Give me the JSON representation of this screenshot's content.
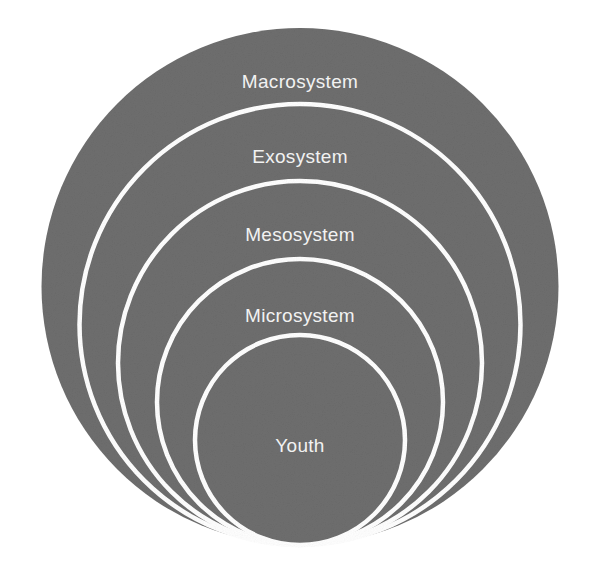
{
  "diagram": {
    "type": "nested-concentric-circles",
    "canvas": {
      "width": 600,
      "height": 574
    },
    "colors": {
      "background": "#ffffff",
      "fill": "#6e6e6e",
      "fill_dark": "#666666",
      "stroke": "#ffffff",
      "label_text": "#f2f2f2"
    },
    "layers": [
      {
        "id": "macrosystem",
        "label": "Macrosystem",
        "level": 1,
        "cx": 300,
        "cy": 286.5,
        "r": 258.5,
        "label_x": 300,
        "label_y": 83
      },
      {
        "id": "exosystem",
        "label": "Exosystem",
        "level": 2,
        "cx": 300,
        "cy": 324.5,
        "r": 220.5,
        "label_x": 300,
        "label_y": 158
      },
      {
        "id": "mesosystem",
        "label": "Mesosystem",
        "level": 3,
        "cx": 300,
        "cy": 363,
        "r": 182,
        "label_x": 300,
        "label_y": 236
      },
      {
        "id": "microsystem",
        "label": "Microsystem",
        "level": 4,
        "cx": 300,
        "cy": 402,
        "r": 143,
        "label_x": 300,
        "label_y": 317
      },
      {
        "id": "youth",
        "label": "Youth",
        "level": 5,
        "cx": 300,
        "cy": 440,
        "r": 105,
        "label_x": 300,
        "label_y": 447
      }
    ]
  }
}
